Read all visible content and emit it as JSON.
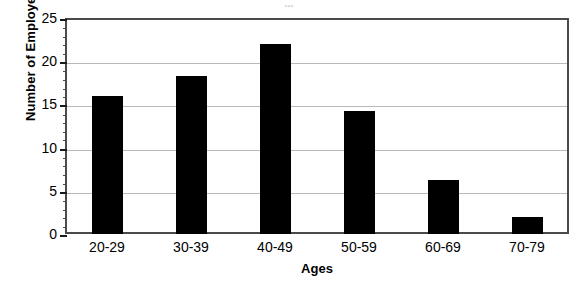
{
  "chart_data": {
    "type": "bar",
    "title": "",
    "title_cropped_remnant": "...",
    "categories": [
      "20-29",
      "30-39",
      "40-49",
      "50-59",
      "60-69",
      "70-79"
    ],
    "values": [
      16,
      18.3,
      22,
      14.2,
      6.2,
      2
    ],
    "series": [
      {
        "name": "Number of Employees",
        "values": [
          16,
          18.3,
          22,
          14.2,
          6.2,
          2
        ]
      }
    ],
    "xlabel": "Ages",
    "ylabel": "Number of Employees",
    "ylim": [
      0,
      25
    ],
    "ytick_labels": [
      "0",
      "5",
      "10",
      "15",
      "20",
      "25"
    ],
    "ytick_values": [
      0,
      5,
      10,
      15,
      20,
      25
    ],
    "yminor_interval": 1,
    "grid": "horizontal",
    "legend": "none",
    "bar_color": "#000000",
    "grid_color": "#b9b9b9",
    "frame_color": "#4a4a4a",
    "background": "#ffffff"
  }
}
